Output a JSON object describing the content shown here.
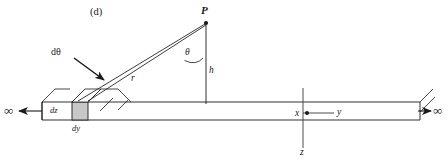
{
  "figure": {
    "panel_label": "(d)",
    "type": "physics-diagram"
  },
  "labels": {
    "point_p": "P",
    "height_h": "h",
    "angle_theta": "θ",
    "differential_angle": "dθ",
    "radius_r": "r",
    "element_dz": "dz",
    "element_dy": "dy",
    "axis_x": "x",
    "axis_y": "y",
    "axis_z": "z",
    "infinity_left": "∞",
    "infinity_right": "∞"
  },
  "colors": {
    "stroke": "#1a1a1a",
    "axis": "#4d4d4d",
    "element_fill": "#c8c8c8",
    "background": "#ffffff",
    "text": "#1a1a1a"
  },
  "geometry": {
    "point_p": [
      206,
      22
    ],
    "origin": [
      303,
      113
    ],
    "rod_left_end": [
      42,
      112
    ],
    "rod_right_end": [
      420,
      112
    ],
    "element_x": [
      72,
      88
    ],
    "rod_top_y": 102,
    "rod_bottom_y": 120,
    "theta_degrees": 47
  }
}
